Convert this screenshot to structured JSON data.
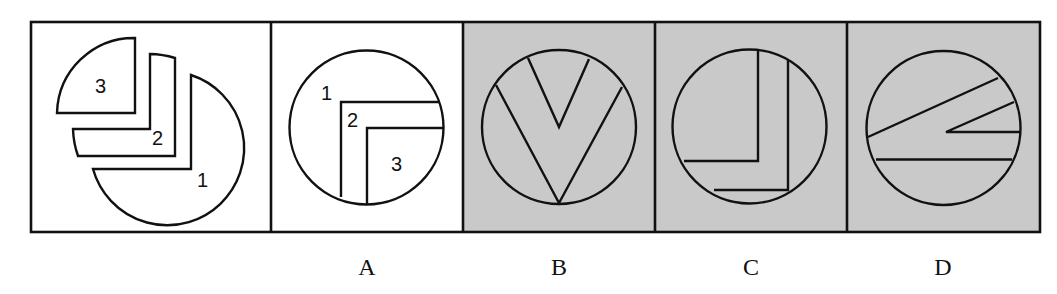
{
  "question": {
    "description": "Figure puzzle: three pieces labeled 1, 2, 3 (left) and four candidate circles A-D",
    "pieces_panel": {
      "labels": [
        "3",
        "2",
        "1"
      ]
    },
    "options": [
      {
        "id": "A",
        "label": "A",
        "shaded": false,
        "piece_labels": [
          "1",
          "2",
          "3"
        ]
      },
      {
        "id": "B",
        "label": "B",
        "shaded": true
      },
      {
        "id": "C",
        "label": "C",
        "shaded": true
      },
      {
        "id": "D",
        "label": "D",
        "shaded": true
      }
    ]
  },
  "colors": {
    "line": "#111111",
    "panel_white": "#ffffff",
    "panel_gray": "#c9c9c9"
  }
}
